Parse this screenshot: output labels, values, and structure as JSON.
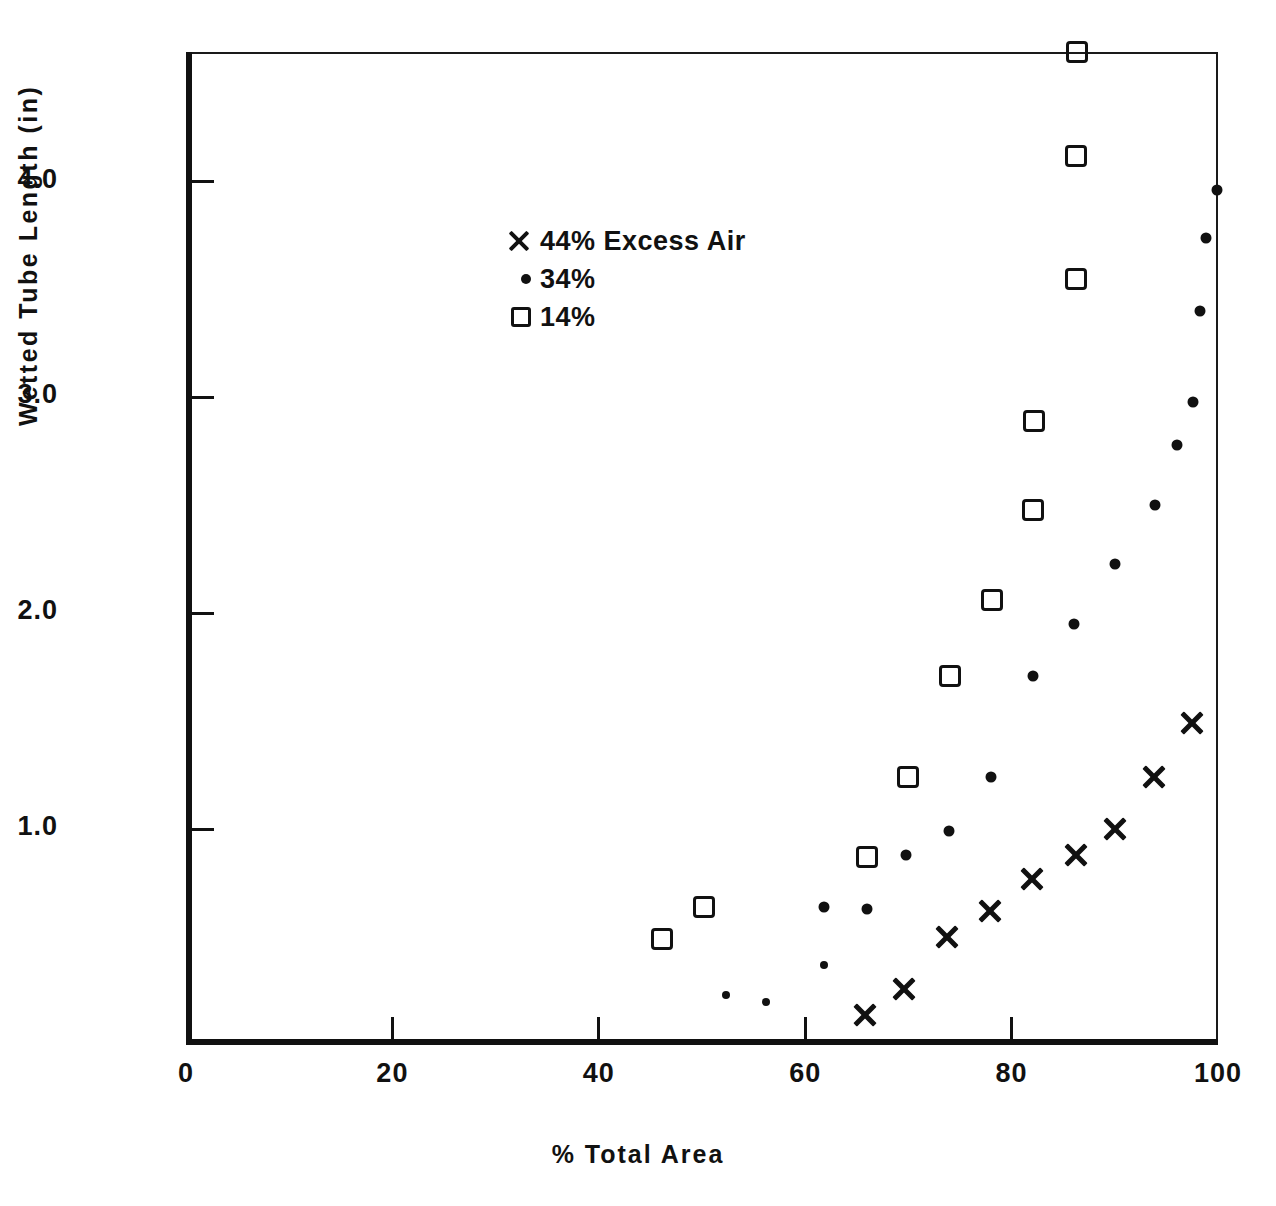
{
  "chart_data": {
    "type": "scatter",
    "title": "",
    "xlabel": "% Total Area",
    "ylabel": "Wetted Tube Length (in)",
    "xlim": [
      0,
      100
    ],
    "ylim": [
      0,
      4.6
    ],
    "xticks": [
      "0",
      "20",
      "40",
      "60",
      "80",
      "100"
    ],
    "xtick_values": [
      0,
      20,
      40,
      60,
      80,
      100
    ],
    "yticks": [
      "1.0",
      "2.0",
      "3.0",
      "4.0"
    ],
    "ytick_values": [
      1.0,
      2.0,
      3.0,
      4.0
    ],
    "grid": false,
    "legend_position": "upper-left-inside",
    "series": [
      {
        "name": "44% Excess Air",
        "marker": "cross",
        "points": [
          {
            "x": 65.8,
            "y": 0.14
          },
          {
            "x": 69.6,
            "y": 0.26
          },
          {
            "x": 73.7,
            "y": 0.5
          },
          {
            "x": 77.9,
            "y": 0.62
          },
          {
            "x": 82.0,
            "y": 0.77
          },
          {
            "x": 86.2,
            "y": 0.88
          },
          {
            "x": 90.0,
            "y": 1.0
          },
          {
            "x": 93.8,
            "y": 1.24
          },
          {
            "x": 97.5,
            "y": 1.49
          }
        ]
      },
      {
        "name": "34%",
        "marker": "dot",
        "points": [
          {
            "x": 52.3,
            "y": 0.23
          },
          {
            "x": 56.2,
            "y": 0.2
          },
          {
            "x": 61.8,
            "y": 0.37
          },
          {
            "x": 61.8,
            "y": 0.64
          },
          {
            "x": 66.0,
            "y": 0.63
          },
          {
            "x": 69.8,
            "y": 0.88
          },
          {
            "x": 73.9,
            "y": 0.99
          },
          {
            "x": 78.0,
            "y": 1.24
          },
          {
            "x": 82.1,
            "y": 1.71
          },
          {
            "x": 86.0,
            "y": 1.95
          },
          {
            "x": 90.0,
            "y": 2.23
          },
          {
            "x": 93.9,
            "y": 2.5
          },
          {
            "x": 96.0,
            "y": 2.78
          },
          {
            "x": 97.6,
            "y": 2.98
          },
          {
            "x": 98.3,
            "y": 3.4
          },
          {
            "x": 98.8,
            "y": 3.74
          },
          {
            "x": 99.9,
            "y": 3.96
          }
        ]
      },
      {
        "name": "14%",
        "marker": "square",
        "points": [
          {
            "x": 46.1,
            "y": 0.49
          },
          {
            "x": 50.2,
            "y": 0.64
          },
          {
            "x": 66.0,
            "y": 0.87
          },
          {
            "x": 70.0,
            "y": 1.24
          },
          {
            "x": 74.0,
            "y": 1.71
          },
          {
            "x": 78.1,
            "y": 2.06
          },
          {
            "x": 82.1,
            "y": 2.48
          },
          {
            "x": 82.2,
            "y": 2.89
          },
          {
            "x": 86.2,
            "y": 3.55
          },
          {
            "x": 86.2,
            "y": 4.12
          },
          {
            "x": 86.3,
            "y": 4.6
          }
        ]
      }
    ]
  },
  "legend": {
    "items": [
      {
        "marker": "cross",
        "label": "44% Excess Air"
      },
      {
        "marker": "dot",
        "label": "34%"
      },
      {
        "marker": "square",
        "label": "14%"
      }
    ]
  },
  "colors": {
    "ink": "#111111",
    "background": "#ffffff"
  }
}
